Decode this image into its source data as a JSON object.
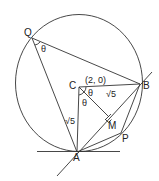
{
  "diagram": {
    "points": {
      "Q": {
        "label": "Q"
      },
      "B": {
        "label": "B"
      },
      "C": {
        "label": "C",
        "coordinate": "(2, 0)"
      },
      "A": {
        "label": "A"
      },
      "M": {
        "label": "M"
      },
      "P": {
        "label": "P"
      }
    },
    "angle_labels": {
      "at_Q": "θ",
      "at_C_upper": "θ",
      "at_C_lower": "θ"
    },
    "length_labels": {
      "CB": "√5",
      "CA": "√5"
    }
  }
}
